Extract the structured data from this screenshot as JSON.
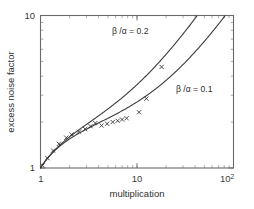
{
  "chart_data": {
    "type": "line",
    "title": "",
    "subtitle": "",
    "xlabel": "multiplication",
    "ylabel": "excess noise factor",
    "xscale": "log",
    "yscale": "log",
    "xlim": [
      1,
      100
    ],
    "ylim": [
      1,
      10
    ],
    "grid": false,
    "legend_position": "inline-annotation",
    "xticks": [
      {
        "value": 1,
        "label": "1"
      },
      {
        "value": 10,
        "label": "10"
      },
      {
        "value": 100,
        "label": "10",
        "sup": "2"
      }
    ],
    "yticks": [
      {
        "value": 1,
        "label": "1"
      },
      {
        "value": 10,
        "label": "10"
      }
    ],
    "series": [
      {
        "name": "beta/alpha = 0.2",
        "k": 0.2,
        "annotation": "β /α = 0.2",
        "annotation_x": 6.0,
        "annotation_y": 7.1,
        "style": "solid",
        "color": "#3a3a3a",
        "model": "McIntyre: F = kM + (2 - 1/M)(1 - k)",
        "x": [
          1.0,
          1.2,
          1.5,
          2.0,
          2.5,
          3.0,
          4.0,
          5.0,
          6.0,
          8.0,
          10.0,
          13.0,
          17.0,
          22.0,
          28.0,
          36.0,
          46.0
        ],
        "y": [
          1.0,
          1.173,
          1.387,
          1.6,
          1.7,
          1.767,
          1.85,
          1.92,
          1.967,
          2.1,
          2.22,
          2.477,
          2.824,
          3.327,
          3.971,
          4.978,
          6.183
        ]
      },
      {
        "name": "beta/alpha = 0.1",
        "k": 0.1,
        "annotation": "β /α = 0.1",
        "annotation_x": 26.0,
        "annotation_y": 3.3,
        "style": "solid",
        "color": "#3a3a3a",
        "model": "McIntyre: F = kM + (2 - 1/M)(1 - k)",
        "x": [
          1.0,
          1.2,
          1.5,
          2.0,
          2.5,
          3.0,
          4.0,
          5.0,
          7.0,
          10.0,
          14.0,
          20.0,
          30.0,
          45.0,
          65.0,
          85.0,
          100.0
        ],
        "y": [
          1.0,
          1.17,
          1.37,
          1.55,
          1.64,
          1.7,
          1.775,
          1.82,
          1.871,
          1.9,
          1.964,
          2.105,
          2.37,
          2.78,
          3.41,
          4.19,
          4.69
        ]
      }
    ],
    "scatter": {
      "name": "measured data",
      "marker": "x",
      "color": "#2e2e2e",
      "points": [
        {
          "x": 1.05,
          "y": 1.04
        },
        {
          "x": 1.18,
          "y": 1.16
        },
        {
          "x": 1.35,
          "y": 1.3
        },
        {
          "x": 1.55,
          "y": 1.44
        },
        {
          "x": 1.85,
          "y": 1.58
        },
        {
          "x": 2.1,
          "y": 1.66
        },
        {
          "x": 2.5,
          "y": 1.73
        },
        {
          "x": 2.9,
          "y": 1.8
        },
        {
          "x": 3.3,
          "y": 1.88
        },
        {
          "x": 3.7,
          "y": 1.97
        },
        {
          "x": 4.3,
          "y": 1.9
        },
        {
          "x": 4.9,
          "y": 1.95
        },
        {
          "x": 5.6,
          "y": 2.0
        },
        {
          "x": 6.3,
          "y": 2.04
        },
        {
          "x": 7.0,
          "y": 2.08
        },
        {
          "x": 7.8,
          "y": 2.12
        },
        {
          "x": 10.5,
          "y": 2.32
        },
        {
          "x": 12.5,
          "y": 2.85
        },
        {
          "x": 18.0,
          "y": 4.6
        }
      ]
    }
  },
  "labels": {
    "y_axis_title": "excess noise factor",
    "x_axis_title": "multiplication",
    "x_tick_1": "1",
    "x_tick_10": "10",
    "x_tick_100_mantissa": "10",
    "x_tick_100_exponent": "2",
    "y_tick_1": "1",
    "y_tick_10": "10",
    "annotation_high": "β /α = 0.2",
    "annotation_low": "β /α = 0.1"
  }
}
